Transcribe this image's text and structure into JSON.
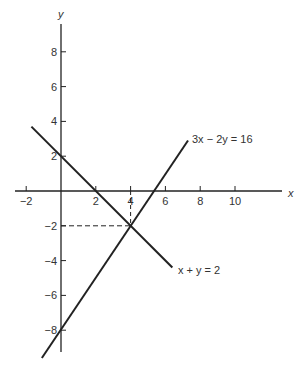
{
  "chart_data": {
    "type": "line",
    "title": "",
    "xlabel": "x",
    "ylabel": "y",
    "xlim": [
      -2.5,
      12.5
    ],
    "ylim": [
      -9.5,
      9.5
    ],
    "grid": false,
    "x_ticks": [
      -2,
      2,
      4,
      6,
      8,
      10
    ],
    "y_ticks": [
      8,
      6,
      4,
      2,
      -2,
      -4,
      -6,
      -8
    ],
    "series": [
      {
        "name": "x + y = 2",
        "equation": "x + y = 2",
        "points": [
          [
            -1.7,
            3.7
          ],
          [
            6.4,
            -4.4
          ]
        ]
      },
      {
        "name": "3x − 2y = 16",
        "equation": "3x − 2y = 16",
        "points": [
          [
            -1.1,
            -9.6
          ],
          [
            7.3,
            2.9
          ]
        ]
      }
    ],
    "annotations": [
      {
        "type": "intersection",
        "x": 4,
        "y": -2,
        "dashed_guides": true
      }
    ]
  },
  "labels": {
    "x_axis": "x",
    "y_axis": "y",
    "line1": "3x − 2y = 16",
    "line2": "x + y = 2",
    "xticks": [
      "−2",
      "2",
      "4",
      "6",
      "8",
      "10"
    ],
    "yticks": [
      "8",
      "6",
      "4",
      "2",
      "−2",
      "−4",
      "−6",
      "−8"
    ]
  },
  "colors": {
    "line": "#222222",
    "text": "#333333"
  }
}
